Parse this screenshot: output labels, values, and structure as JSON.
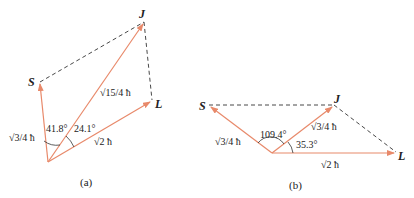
{
  "colors": {
    "vector": "#e8896a",
    "dashed": "#333333",
    "text": "#222222"
  },
  "panel_a": {
    "caption": "(a)",
    "labels": {
      "S": "S",
      "J": "J",
      "L": "L"
    },
    "magnitudes": {
      "S": "√3/4 ħ",
      "J": "√15/4 ħ",
      "L": "√2 ħ"
    },
    "angles": {
      "S_J": "41.8°",
      "J_L": "24.1°"
    }
  },
  "panel_b": {
    "caption": "(b)",
    "labels": {
      "S": "S",
      "J": "J",
      "L": "L"
    },
    "magnitudes": {
      "S": "√3/4 ħ",
      "J": "√3/4 ħ",
      "L": "√2 ħ"
    },
    "angles": {
      "S_J": "109.4°",
      "J_L": "35.3°"
    }
  }
}
